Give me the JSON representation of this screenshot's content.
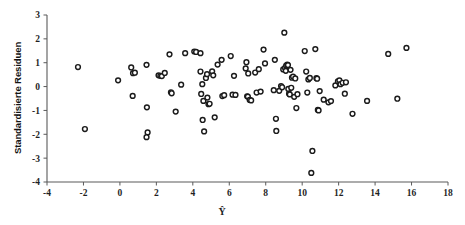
{
  "chart_data": {
    "type": "scatter",
    "title": "",
    "xlabel": "Ŷ",
    "ylabel": "Standardisierte Residuen",
    "xlim": [
      -4,
      18
    ],
    "ylim": [
      -4,
      3
    ],
    "xticks": [
      -4,
      -2,
      0,
      2,
      4,
      6,
      8,
      10,
      12,
      14,
      16,
      18
    ],
    "yticks": [
      3,
      2,
      1,
      0,
      -1,
      -2,
      -3,
      -4
    ],
    "xtick_labels": [
      "-4",
      "-2",
      "0",
      "2",
      "4",
      "6",
      "8",
      "10",
      "12",
      "14",
      "16",
      "18"
    ],
    "ytick_labels": [
      "3",
      "2",
      "1",
      "0",
      "-1",
      "-2",
      "-3",
      "-4"
    ],
    "grid": false,
    "legend": null,
    "marker": {
      "shape": "circle",
      "fill_color": "#ffffff",
      "edge_color": "#1b1b1b",
      "radius_px": 2.4
    },
    "axis_color": "#5a5a5a",
    "background_color": "#ffffff",
    "n_points": 119,
    "points": [
      [
        -2.3,
        0.82
      ],
      [
        -1.92,
        -1.78
      ],
      [
        -0.1,
        0.26
      ],
      [
        0.62,
        0.8
      ],
      [
        0.72,
        0.56
      ],
      [
        0.82,
        0.58
      ],
      [
        0.7,
        -0.39
      ],
      [
        1.46,
        0.91
      ],
      [
        1.48,
        -0.87
      ],
      [
        1.52,
        -1.92
      ],
      [
        1.46,
        -2.12
      ],
      [
        2.12,
        0.47
      ],
      [
        2.22,
        0.45
      ],
      [
        2.3,
        0.44
      ],
      [
        2.46,
        0.57
      ],
      [
        2.72,
        1.35
      ],
      [
        2.8,
        -0.24
      ],
      [
        2.84,
        -0.28
      ],
      [
        3.06,
        -1.05
      ],
      [
        3.36,
        0.08
      ],
      [
        3.58,
        1.4
      ],
      [
        4.08,
        1.47
      ],
      [
        4.18,
        1.45
      ],
      [
        4.42,
        1.4
      ],
      [
        4.42,
        0.63
      ],
      [
        4.46,
        -0.31
      ],
      [
        4.52,
        0.1
      ],
      [
        4.58,
        -0.6
      ],
      [
        4.54,
        -1.4
      ],
      [
        4.62,
        -1.88
      ],
      [
        4.72,
        0.36
      ],
      [
        4.78,
        0.52
      ],
      [
        4.8,
        -0.46
      ],
      [
        4.86,
        -0.74
      ],
      [
        4.92,
        -0.72
      ],
      [
        5.06,
        0.64
      ],
      [
        5.12,
        0.47
      ],
      [
        5.2,
        -1.29
      ],
      [
        5.36,
        0.92
      ],
      [
        5.58,
        1.12
      ],
      [
        5.62,
        -0.4
      ],
      [
        5.72,
        -0.36
      ],
      [
        6.08,
        1.28
      ],
      [
        6.18,
        -0.34
      ],
      [
        6.26,
        0.45
      ],
      [
        6.34,
        -0.35
      ],
      [
        6.9,
        0.76
      ],
      [
        6.94,
        1.02
      ],
      [
        6.98,
        -0.41
      ],
      [
        7.02,
        -0.42
      ],
      [
        7.04,
        0.55
      ],
      [
        7.12,
        -0.56
      ],
      [
        7.2,
        -0.58
      ],
      [
        7.42,
        0.59
      ],
      [
        7.5,
        -0.25
      ],
      [
        7.62,
        0.73
      ],
      [
        7.72,
        -0.21
      ],
      [
        7.88,
        1.55
      ],
      [
        7.96,
        0.97
      ],
      [
        8.44,
        -0.15
      ],
      [
        8.5,
        1.12
      ],
      [
        8.56,
        -1.35
      ],
      [
        8.58,
        -1.86
      ],
      [
        8.74,
        -0.18
      ],
      [
        8.84,
        0.02
      ],
      [
        8.9,
        -0.03
      ],
      [
        8.96,
        0.72
      ],
      [
        9.02,
        2.26
      ],
      [
        9.06,
        0.78
      ],
      [
        9.1,
        0.66
      ],
      [
        9.12,
        0.88
      ],
      [
        9.18,
        0.92
      ],
      [
        9.22,
        0.9
      ],
      [
        9.24,
        -0.1
      ],
      [
        9.28,
        -0.3
      ],
      [
        9.32,
        -0.33
      ],
      [
        9.36,
        0.7
      ],
      [
        9.4,
        -0.05
      ],
      [
        9.44,
        0.37
      ],
      [
        9.5,
        0.42
      ],
      [
        9.56,
        -0.43
      ],
      [
        9.62,
        0.34
      ],
      [
        9.68,
        -0.9
      ],
      [
        9.74,
        -0.32
      ],
      [
        10.14,
        1.49
      ],
      [
        10.22,
        0.63
      ],
      [
        10.28,
        -0.25
      ],
      [
        10.34,
        0.3
      ],
      [
        10.42,
        0.36
      ],
      [
        10.5,
        -3.62
      ],
      [
        10.56,
        -2.7
      ],
      [
        10.72,
        1.57
      ],
      [
        10.78,
        0.35
      ],
      [
        10.82,
        0.33
      ],
      [
        10.86,
        -0.98
      ],
      [
        10.9,
        -1.0
      ],
      [
        10.96,
        -0.19
      ],
      [
        11.18,
        -0.55
      ],
      [
        11.44,
        -0.66
      ],
      [
        11.58,
        -0.61
      ],
      [
        11.82,
        0.05
      ],
      [
        11.96,
        0.22
      ],
      [
        12.04,
        0.26
      ],
      [
        12.1,
        0.1
      ],
      [
        12.22,
        0.16
      ],
      [
        12.34,
        -0.3
      ],
      [
        12.4,
        0.18
      ],
      [
        12.76,
        -1.14
      ],
      [
        13.56,
        -0.6
      ],
      [
        14.72,
        1.37
      ],
      [
        15.22,
        -0.51
      ],
      [
        15.72,
        1.62
      ]
    ]
  }
}
